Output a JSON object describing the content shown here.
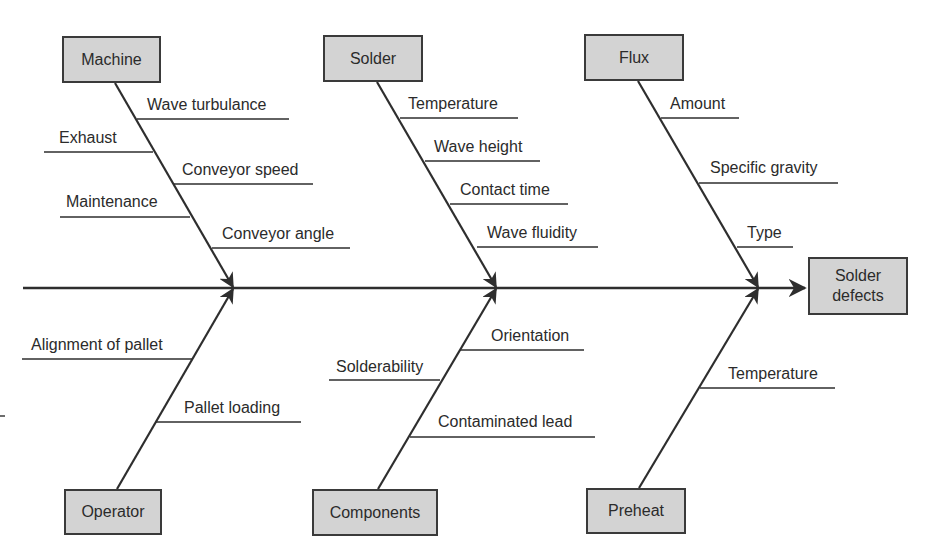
{
  "diagram": {
    "type": "fishbone",
    "effect": "Solder defects",
    "colors": {
      "box_fill": "#d3d3d3",
      "line": "#2e2e2e",
      "text": "#2b2b2b"
    },
    "categories": [
      {
        "name": "Machine",
        "position": "top",
        "causes": [
          "Wave turbulance",
          "Exhaust",
          "Conveyor speed",
          "Maintenance",
          "Conveyor angle"
        ]
      },
      {
        "name": "Solder",
        "position": "top",
        "causes": [
          "Temperature",
          "Wave height",
          "Contact time",
          "Wave fluidity"
        ]
      },
      {
        "name": "Flux",
        "position": "top",
        "causes": [
          "Amount",
          "Specific gravity",
          "Type"
        ]
      },
      {
        "name": "Operator",
        "position": "bottom",
        "causes": [
          "Alignment of pallet",
          "Pallet loading"
        ]
      },
      {
        "name": "Components",
        "position": "bottom",
        "causes": [
          "Orientation",
          "Solderability",
          "Contaminated lead"
        ]
      },
      {
        "name": "Preheat",
        "position": "bottom",
        "causes": [
          "Temperature"
        ]
      }
    ]
  }
}
